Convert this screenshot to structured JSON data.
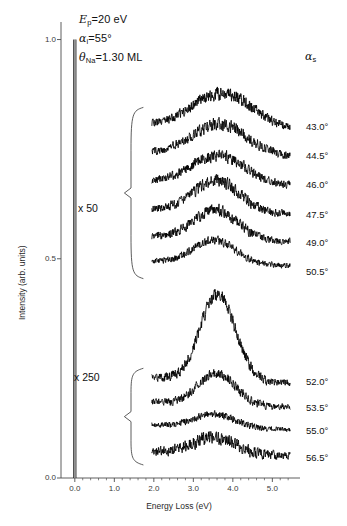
{
  "figure": {
    "background": "#ffffff",
    "trace_color": "#000000",
    "axis_color": "#4d4d4d"
  },
  "annotations": {
    "params": [
      {
        "id": "beam-energy",
        "symbol": "E",
        "sub": "p",
        "text": "=20 eV"
      },
      {
        "id": "incident-angle",
        "symbol": "α",
        "sub": "i",
        "text": "=55°"
      },
      {
        "id": "na-coverage",
        "symbol": "θ",
        "sub": "Na",
        "text": "=1.30 ML"
      }
    ],
    "scale_upper": "x 50",
    "scale_lower": "x 250",
    "alpha_s_symbol": "α",
    "alpha_s_sub": "s"
  },
  "chart_data": {
    "type": "line",
    "title": "",
    "subtitle": "",
    "xlabel": "Energy Loss (eV)",
    "ylabel": "Intensity (arb. units)",
    "xlim": [
      -0.35,
      5.7
    ],
    "ylim": [
      0.0,
      1.04
    ],
    "grid": false,
    "legend_position": "right-labels",
    "xticks_major": [
      0.0,
      1.0,
      2.0,
      3.0,
      4.0,
      5.0
    ],
    "xticks_major_labels": [
      "0.0",
      "1.0",
      "2.0",
      "3.0",
      "4.0",
      "5.0"
    ],
    "xticks_minor_step": 0.2,
    "yticks_major": [
      0.0,
      0.5,
      1.0
    ],
    "yticks_major_labels": [
      "0.0",
      "0.5",
      "1.0"
    ],
    "elastic_peak": {
      "x": 0.0,
      "y_top": 1.0,
      "label": "elastic peak"
    },
    "scale_groups": [
      {
        "label": "x 50",
        "series_indices": [
          0,
          1,
          2,
          3,
          4,
          5
        ]
      },
      {
        "label": "x 250",
        "series_indices": [
          6,
          7,
          8,
          9
        ]
      }
    ],
    "x_range_of_traces": [
      1.95,
      5.45
    ],
    "series": [
      {
        "name": "43.0°",
        "label": "43.0°",
        "group": "x 50",
        "baseline": 0.795,
        "peak_x": 3.75,
        "peak_height": 0.075,
        "peak_width": 1.25,
        "noise": 0.016,
        "label_y": 0.8
      },
      {
        "name": "44.5°",
        "label": "44.5°",
        "group": "x 50",
        "baseline": 0.73,
        "peak_x": 3.7,
        "peak_height": 0.068,
        "peak_width": 1.2,
        "noise": 0.015,
        "label_y": 0.735
      },
      {
        "name": "46.0°",
        "label": "46.0°",
        "group": "x 50",
        "baseline": 0.665,
        "peak_x": 3.65,
        "peak_height": 0.062,
        "peak_width": 1.15,
        "noise": 0.014,
        "label_y": 0.668
      },
      {
        "name": "47.5°",
        "label": "47.5°",
        "group": "x 50",
        "baseline": 0.6,
        "peak_x": 3.6,
        "peak_height": 0.07,
        "peak_width": 1.0,
        "noise": 0.014,
        "label_y": 0.6
      },
      {
        "name": "49.0°",
        "label": "49.0°",
        "group": "x 50",
        "baseline": 0.538,
        "peak_x": 3.58,
        "peak_height": 0.065,
        "peak_width": 0.95,
        "noise": 0.013,
        "label_y": 0.535
      },
      {
        "name": "50.5°",
        "label": "50.5°",
        "group": "x 50",
        "baseline": 0.482,
        "peak_x": 3.55,
        "peak_height": 0.052,
        "peak_width": 0.9,
        "noise": 0.01,
        "label_y": 0.47
      },
      {
        "name": "52.0°",
        "label": "52.0°",
        "group": "x 250",
        "baseline": 0.215,
        "peak_x": 3.62,
        "peak_height": 0.195,
        "peak_width": 0.78,
        "noise": 0.015,
        "label_y": 0.218
      },
      {
        "name": "53.5°",
        "label": "53.5°",
        "group": "x 250",
        "baseline": 0.16,
        "peak_x": 3.6,
        "peak_height": 0.072,
        "peak_width": 0.8,
        "noise": 0.012,
        "label_y": 0.16
      },
      {
        "name": "55.0°",
        "label": "55.0°",
        "group": "x 250",
        "baseline": 0.108,
        "peak_x": 3.55,
        "peak_height": 0.03,
        "peak_width": 0.85,
        "noise": 0.009,
        "label_y": 0.108
      },
      {
        "name": "56.5°",
        "label": "56.5°",
        "group": "x 250",
        "baseline": 0.048,
        "peak_x": 3.55,
        "peak_height": 0.035,
        "peak_width": 0.9,
        "noise": 0.016,
        "label_y": 0.045
      }
    ]
  }
}
